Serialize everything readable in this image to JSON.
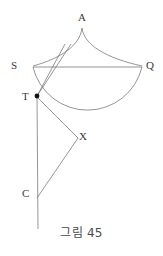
{
  "figure": {
    "caption": "그림 45",
    "stroke_color": "#6e6e6e",
    "label_color": "#3a3a3a",
    "background_color": "#ffffff",
    "point_marker_color": "#111111"
  },
  "labels": {
    "a": "A",
    "s": "S",
    "q": "Q",
    "t": "T",
    "x": "X",
    "c": "C"
  },
  "geometry": {
    "points": {
      "A": [
        82,
        26
      ],
      "S": [
        33,
        67
      ],
      "Q": [
        142,
        67
      ],
      "T": [
        37,
        96
      ],
      "X": [
        77,
        137
      ],
      "C": [
        37,
        196
      ],
      "apex_inner": [
        64,
        45
      ],
      "axis_bottom": [
        38,
        229
      ]
    },
    "segments": [
      {
        "name": "chord-sq",
        "from": "S",
        "to": "Q"
      },
      {
        "name": "line-t-apex-inner",
        "from": "T",
        "to": "apex_inner"
      },
      {
        "name": "line-t-apex-secondary",
        "from": "T",
        "to": "apex_inner"
      },
      {
        "name": "axis-t-c-bottom",
        "from": "T",
        "to": "axis_bottom"
      },
      {
        "name": "line-t-x",
        "from": "T",
        "to": "X"
      },
      {
        "name": "line-x-c",
        "from": "X",
        "to": "C"
      }
    ],
    "curves": [
      {
        "name": "cusp-curve-left",
        "from": "A",
        "to": "S"
      },
      {
        "name": "cusp-curve-right",
        "from": "A",
        "to": "Q"
      },
      {
        "name": "major-arc-sq",
        "from": "S",
        "to": "Q",
        "bulge": "downward"
      }
    ]
  }
}
